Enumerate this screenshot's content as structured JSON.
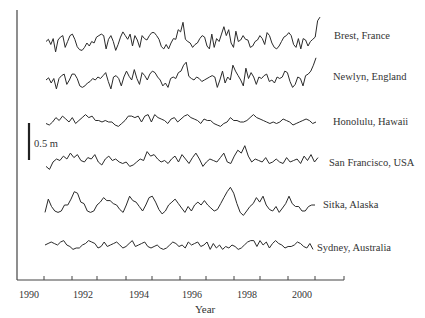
{
  "chart_data": {
    "type": "line",
    "title": "",
    "xlabel": "Year",
    "ylabel": "",
    "xlim": [
      1990,
      2001
    ],
    "x_ticks": [
      1990,
      1991,
      1992,
      1993,
      1994,
      1995,
      1996,
      1997,
      1998,
      1999,
      2000,
      2001
    ],
    "x_tick_labels": [
      "1990",
      "1992",
      "1994",
      "1996",
      "1998",
      "2000"
    ],
    "grid": false,
    "legend": "inline labels at right end of each series",
    "scale_bar": {
      "label": "0.5 m",
      "length_m": 0.5
    },
    "series_note": "Stacked monthly sea-level anomaly time series (offset vertically); values are approximate relative anomalies in metres",
    "series": [
      {
        "name": "Brest, France",
        "baseline_y": 43,
        "values": [
          0.02,
          0.05,
          -0.02,
          0.06,
          -0.12,
          0.04,
          0.08,
          0.1,
          -0.06,
          0.02,
          0.1,
          0.12,
          0.05,
          -0.05,
          -0.09,
          -0.1,
          -0.06,
          0.0,
          -0.04,
          0.02,
          0.0,
          0.08,
          0.1,
          0.12,
          0.1,
          -0.08,
          0.05,
          0.1,
          0.02,
          -0.1,
          -0.02,
          0.08,
          0.15,
          0.1,
          0.05,
          0.12,
          -0.04,
          0.1,
          0.04,
          -0.06,
          0.1,
          0.06,
          0.04,
          0.1,
          0.14,
          0.14,
          0.1,
          0.05,
          -0.05,
          -0.08,
          -0.02,
          -0.08,
          0.0,
          0.06,
          0.05,
          0.18,
          0.15,
          0.28,
          0.05,
          0.02,
          0.0,
          -0.06,
          -0.02,
          0.0,
          0.06,
          0.1,
          0.08,
          -0.04,
          -0.08,
          0.12,
          -0.06,
          0.06,
          0.02,
          0.12,
          0.22,
          0.1,
          0.18,
          0.0,
          -0.06,
          0.16,
          0.02,
          0.04,
          0.1,
          0.05,
          0.04,
          -0.06,
          -0.04,
          0.02,
          0.04,
          0.1,
          0.06,
          -0.02,
          0.14,
          0.1,
          0.0,
          -0.06,
          -0.08,
          -0.04,
          0.02,
          0.08,
          0.1,
          0.14,
          0.1,
          -0.02,
          -0.06,
          0.06,
          -0.08,
          0.06,
          0.04,
          -0.04,
          0.02,
          0.05,
          0.08,
          0.3,
          0.35
        ]
      },
      {
        "name": "Newlyn, England",
        "baseline_y": 80,
        "values": [
          0.0,
          0.03,
          -0.04,
          0.02,
          -0.12,
          0.02,
          0.06,
          0.08,
          -0.06,
          0.0,
          0.08,
          0.08,
          0.02,
          -0.08,
          -0.1,
          -0.08,
          -0.04,
          -0.02,
          0.02,
          0.0,
          0.04,
          0.02,
          0.06,
          0.1,
          -0.02,
          -0.12,
          0.04,
          0.06,
          0.02,
          -0.08,
          0.04,
          0.12,
          0.05,
          0.0,
          0.14,
          0.02,
          -0.06,
          0.1,
          0.06,
          0.0,
          0.08,
          0.12,
          0.1,
          0.04,
          0.0,
          -0.08,
          -0.04,
          -0.1,
          0.02,
          0.04,
          0.02,
          0.1,
          0.12,
          0.2,
          0.24,
          0.05,
          0.02,
          0.0,
          0.04,
          0.02,
          -0.02,
          0.0,
          0.02,
          0.04,
          0.06,
          0.04,
          -0.1,
          0.0,
          0.12,
          -0.04,
          0.04,
          0.0,
          0.2,
          0.12,
          0.06,
          0.0,
          -0.08,
          0.16,
          0.02,
          0.1,
          0.04,
          -0.06,
          0.04,
          0.02,
          0.06,
          0.08,
          -0.02,
          0.0,
          -0.04,
          0.04,
          0.02,
          0.04,
          0.12,
          0.1,
          -0.02,
          -0.1,
          -0.06,
          0.04,
          0.02,
          -0.08,
          0.06,
          0.08,
          0.12,
          0.2,
          0.3
        ]
      },
      {
        "name": "Honolulu, Hawaii",
        "baseline_y": 122,
        "values": [
          -0.02,
          -0.04,
          0.0,
          0.06,
          0.02,
          0.08,
          0.04,
          0.0,
          0.06,
          -0.02,
          0.02,
          0.06,
          0.1,
          0.06,
          0.08,
          0.02,
          0.02,
          0.0,
          0.02,
          0.0,
          0.0,
          -0.04,
          -0.06,
          -0.02,
          0.02,
          0.08,
          0.08,
          0.06,
          0.08,
          0.0,
          0.08,
          0.1,
          0.0,
          0.1,
          0.06,
          0.04,
          0.02,
          -0.02,
          0.04,
          0.06,
          0.0,
          0.04,
          0.08,
          0.1,
          0.06,
          0.04,
          0.02,
          -0.02,
          0.04,
          0.02,
          0.02,
          -0.02,
          -0.04,
          -0.06,
          -0.02,
          0.0,
          0.06,
          0.02,
          0.02,
          0.0,
          0.0,
          0.02,
          0.06,
          0.1,
          0.06,
          0.04,
          0.02,
          0.0,
          -0.02,
          0.0,
          -0.02,
          0.0,
          0.04,
          0.02,
          0.0,
          -0.04,
          -0.02,
          0.0,
          0.02,
          0.04,
          0.02,
          -0.02,
          0.0
        ]
      },
      {
        "name": "San Francisco, USA",
        "baseline_y": 162,
        "values": [
          -0.06,
          -0.1,
          0.0,
          0.04,
          0.02,
          0.08,
          0.04,
          0.12,
          0.06,
          0.1,
          0.02,
          0.0,
          0.06,
          0.04,
          0.1,
          0.0,
          -0.04,
          0.04,
          0.08,
          0.02,
          0.04,
          0.0,
          -0.02,
          0.0,
          -0.06,
          -0.04,
          0.0,
          0.04,
          0.02,
          0.14,
          0.08,
          0.1,
          0.04,
          0.0,
          0.02,
          -0.02,
          0.04,
          0.08,
          0.0,
          0.1,
          0.04,
          -0.02,
          0.06,
          0.12,
          0.04,
          -0.06,
          0.0,
          0.04,
          0.02,
          0.0,
          0.06,
          0.12,
          0.0,
          -0.02,
          0.08,
          0.16,
          0.12,
          0.22,
          0.08,
          0.0,
          0.04,
          0.02,
          0.0,
          0.06,
          -0.02,
          0.0,
          0.04,
          0.0,
          -0.02,
          0.06,
          0.0,
          0.02,
          0.04,
          -0.02,
          0.08,
          0.02,
          0.1,
          0.0,
          0.06
        ]
      },
      {
        "name": "Sitka, Alaska",
        "baseline_y": 208,
        "values": [
          -0.06,
          0.12,
          0.02,
          -0.04,
          -0.06,
          -0.04,
          0.04,
          0.04,
          0.12,
          0.22,
          0.2,
          0.08,
          0.06,
          -0.04,
          -0.06,
          -0.04,
          0.04,
          0.08,
          0.14,
          0.1,
          0.1,
          0.06,
          0.04,
          -0.02,
          -0.06,
          0.04,
          0.16,
          0.1,
          0.08,
          0.02,
          -0.04,
          0.04,
          0.14,
          0.16,
          0.08,
          -0.02,
          -0.08,
          -0.04,
          0.04,
          0.08,
          0.12,
          0.06,
          0.0,
          -0.06,
          0.02,
          -0.04,
          0.04,
          0.08,
          0.04,
          0.1,
          0.04,
          0.0,
          -0.04,
          -0.02,
          0.06,
          0.14,
          0.22,
          0.28,
          0.2,
          0.06,
          -0.06,
          -0.1,
          -0.04,
          0.02,
          0.06,
          0.14,
          0.08,
          0.16,
          0.04,
          -0.02,
          -0.04,
          0.02,
          -0.06,
          0.0,
          0.06,
          0.16,
          0.06,
          0.02,
          0.02,
          -0.04,
          -0.04,
          0.02,
          0.04,
          0.04
        ]
      },
      {
        "name": "Sydney, Australia",
        "baseline_y": 245,
        "values": [
          0.0,
          0.02,
          0.04,
          0.02,
          0.0,
          0.04,
          0.06,
          0.0,
          -0.02,
          -0.06,
          -0.04,
          -0.04,
          0.0,
          0.02,
          0.06,
          0.04,
          0.02,
          -0.04,
          -0.02,
          0.04,
          -0.02,
          0.0,
          0.02,
          0.04,
          0.0,
          -0.04,
          -0.02,
          0.02,
          0.06,
          -0.02,
          0.0,
          0.02,
          0.04,
          -0.02,
          -0.04,
          -0.02,
          0.0,
          -0.04,
          -0.06,
          -0.04,
          0.0,
          0.04,
          0.02,
          -0.02,
          0.0,
          -0.04,
          0.04,
          0.0,
          0.02,
          0.04,
          -0.02,
          0.0,
          0.04,
          -0.06,
          0.02,
          -0.04,
          0.0,
          -0.06,
          -0.02,
          -0.04,
          0.0,
          -0.02,
          -0.06,
          -0.04,
          0.0,
          0.04,
          0.06,
          0.06,
          -0.02,
          0.06,
          0.0,
          0.04,
          -0.04,
          0.02,
          0.06,
          0.02,
          0.0,
          -0.04,
          -0.02,
          -0.02,
          0.0,
          0.04,
          0.02,
          -0.02,
          -0.04,
          0.02,
          -0.06
        ]
      }
    ]
  },
  "labels": {
    "xlabel": "Year",
    "scale_bar": "0.5 m",
    "ticks": [
      "1990",
      "1992",
      "1994",
      "1996",
      "1998",
      "2000"
    ],
    "series": [
      "Brest, France",
      "Newlyn, England",
      "Honolulu, Hawaii",
      "San Francisco, USA",
      "Sitka, Alaska",
      "Sydney, Australia"
    ]
  }
}
